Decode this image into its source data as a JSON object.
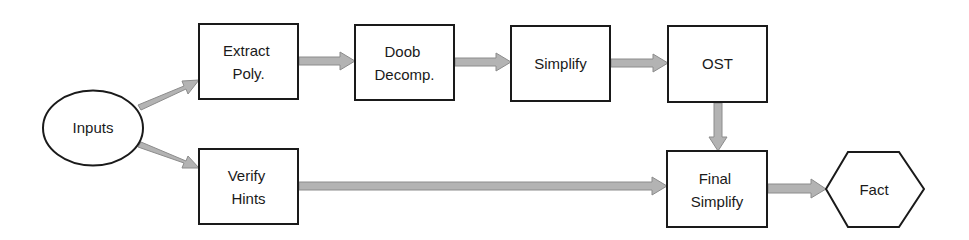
{
  "diagram": {
    "type": "flowchart",
    "nodes": {
      "inputs": {
        "shape": "ellipse",
        "lines": [
          "Inputs"
        ]
      },
      "extract_poly": {
        "shape": "rect",
        "lines": [
          "Extract",
          "Poly."
        ]
      },
      "doob_decomp": {
        "shape": "rect",
        "lines": [
          "Doob",
          "Decomp."
        ]
      },
      "simplify": {
        "shape": "rect",
        "lines": [
          "Simplify"
        ]
      },
      "ost": {
        "shape": "rect",
        "lines": [
          "OST"
        ]
      },
      "verify_hints": {
        "shape": "rect",
        "lines": [
          "Verify",
          "Hints"
        ]
      },
      "final_simplify": {
        "shape": "rect",
        "lines": [
          "Final",
          "Simplify"
        ]
      },
      "fact": {
        "shape": "hexagon",
        "lines": [
          "Fact"
        ]
      }
    },
    "edges": [
      {
        "from": "Inputs",
        "to": "Extract Poly."
      },
      {
        "from": "Inputs",
        "to": "Verify Hints"
      },
      {
        "from": "Extract Poly.",
        "to": "Doob Decomp."
      },
      {
        "from": "Doob Decomp.",
        "to": "Simplify"
      },
      {
        "from": "Simplify",
        "to": "OST"
      },
      {
        "from": "OST",
        "to": "Final Simplify"
      },
      {
        "from": "Verify Hints",
        "to": "Final Simplify"
      },
      {
        "from": "Final Simplify",
        "to": "Fact"
      }
    ],
    "colors": {
      "stroke": "#1a1a1a",
      "arrow_fill": "#b3b3b3",
      "arrow_stroke": "#8c8c8c",
      "background": "#ffffff"
    }
  }
}
